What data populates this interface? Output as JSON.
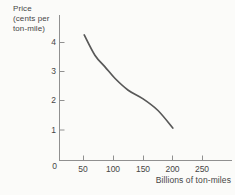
{
  "figure": {
    "background": "#fbfbf9",
    "axis_color": "#909090",
    "text_color": "#464646",
    "curve_color": "#585858"
  },
  "chart_data": {
    "type": "line",
    "title": "",
    "xlabel": "Billions of ton-miles",
    "ylabel_lines": [
      "Price",
      "(cents per",
      "ton-mile)"
    ],
    "x_ticks": [
      50,
      100,
      150,
      200,
      250
    ],
    "y_ticks": [
      0,
      1,
      2,
      3,
      4
    ],
    "origin_label": "0",
    "xlim": [
      0,
      300
    ],
    "ylim": [
      0,
      5
    ],
    "grid": false,
    "legend_position": "none",
    "series": [
      {
        "name": "demand-for-rail-freight",
        "points": [
          [
            52,
            4.3
          ],
          [
            70,
            3.6
          ],
          [
            87,
            3.2
          ],
          [
            104,
            2.8
          ],
          [
            126,
            2.4
          ],
          [
            151,
            2.1
          ],
          [
            176,
            1.7
          ],
          [
            201,
            1.1
          ]
        ]
      }
    ]
  }
}
